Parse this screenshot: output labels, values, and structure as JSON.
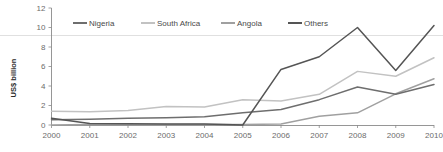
{
  "chart_data": {
    "type": "line",
    "title": "",
    "subtitle": "",
    "xlabel": "",
    "ylabel": "US$ billion",
    "x": [
      2000,
      2001,
      2002,
      2003,
      2004,
      2005,
      2006,
      2007,
      2008,
      2009,
      2010
    ],
    "categories": [
      "2000",
      "2001",
      "2002",
      "2003",
      "2004",
      "2005",
      "2006",
      "2007",
      "2008",
      "2009",
      "2010"
    ],
    "xlim": [
      2000,
      2010
    ],
    "ylim": [
      0,
      12
    ],
    "yticks": [
      0,
      2,
      4,
      6,
      8,
      10,
      12
    ],
    "ytick_labels": [
      "0",
      "2",
      "4",
      "6",
      "8",
      "10",
      "12"
    ],
    "grid": false,
    "legend_position": "top",
    "series": [
      {
        "name": "Nigeria",
        "color": "#6e6e6e",
        "values": [
          0.55,
          0.6,
          0.7,
          0.75,
          0.85,
          1.25,
          1.6,
          2.6,
          3.9,
          3.15,
          4.15
        ]
      },
      {
        "name": "South Africa",
        "color": "#c2c2c2",
        "values": [
          1.4,
          1.35,
          1.5,
          1.9,
          1.85,
          2.6,
          2.45,
          3.15,
          5.5,
          5.0,
          6.9
        ]
      },
      {
        "name": "Angola",
        "color": "#a0a0a0",
        "values": [
          0.0,
          0.05,
          0.05,
          0.05,
          0.05,
          0.05,
          0.1,
          0.9,
          1.25,
          3.2,
          4.75
        ]
      },
      {
        "name": "Others",
        "color": "#555555",
        "values": [
          0.7,
          0.15,
          0.12,
          0.1,
          0.1,
          0.0,
          5.7,
          7.0,
          10.0,
          5.6,
          10.2
        ]
      }
    ]
  },
  "legend": {
    "items": [
      {
        "label": "Nigeria",
        "color": "#6e6e6e"
      },
      {
        "label": "South Africa",
        "color": "#c2c2c2"
      },
      {
        "label": "Angola",
        "color": "#a0a0a0"
      },
      {
        "label": "Others",
        "color": "#555555"
      }
    ]
  },
  "axes": {
    "y_axis_title": "US$ billion",
    "y_ticks": [
      "12",
      "10",
      "8",
      "6",
      "4",
      "2",
      "0"
    ],
    "x_ticks": [
      "2000",
      "2001",
      "2002",
      "2003",
      "2004",
      "2005",
      "2006",
      "2007",
      "2008",
      "2009",
      "2010"
    ]
  }
}
